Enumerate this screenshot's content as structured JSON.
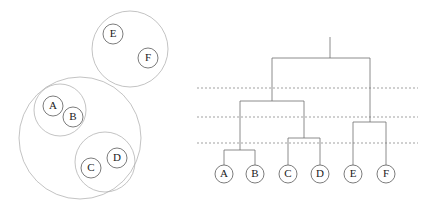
{
  "figure": {
    "width": 423,
    "height": 213,
    "background": "#ffffff",
    "stroke_light": "#a9a9a9",
    "stroke_dark": "#5a5a5a",
    "stroke_link": "#6e6e6e",
    "cut_color": "#7a7a7a"
  },
  "left_panel": {
    "title": "nested-cluster-venn",
    "items": [
      {
        "label": "A",
        "cx": 53,
        "cy": 106,
        "r": 10
      },
      {
        "label": "B",
        "cx": 73,
        "cy": 117,
        "r": 10
      },
      {
        "label": "C",
        "cx": 91,
        "cy": 168,
        "r": 10
      },
      {
        "label": "D",
        "cx": 117,
        "cy": 158,
        "r": 10
      },
      {
        "label": "E",
        "cx": 113,
        "cy": 34,
        "r": 10
      },
      {
        "label": "F",
        "cx": 148,
        "cy": 58,
        "r": 10
      }
    ],
    "groups": [
      {
        "name": "group-ab",
        "cx": 60,
        "cy": 110,
        "r": 26
      },
      {
        "name": "group-cd",
        "cx": 105,
        "cy": 162,
        "r": 30
      },
      {
        "name": "group-abcd",
        "cx": 80,
        "cy": 138,
        "r": 61
      },
      {
        "name": "group-ef",
        "cx": 130,
        "cy": 49,
        "r": 38
      }
    ]
  },
  "right_panel": {
    "title": "hierarchical-dendrogram",
    "leaves": [
      {
        "label": "A",
        "cx": 224,
        "cy": 174,
        "r": 9
      },
      {
        "label": "B",
        "cx": 255,
        "cy": 174,
        "r": 9
      },
      {
        "label": "C",
        "cx": 288,
        "cy": 174,
        "r": 9
      },
      {
        "label": "D",
        "cx": 320,
        "cy": 174,
        "r": 9
      },
      {
        "label": "E",
        "cx": 353,
        "cy": 174,
        "r": 9
      },
      {
        "label": "F",
        "cx": 386,
        "cy": 174,
        "r": 9
      }
    ],
    "links": [
      {
        "name": "merge-ab",
        "left": 224,
        "right": 255,
        "y": 150,
        "left_y": 165,
        "right_y": 165
      },
      {
        "name": "merge-cd",
        "left": 288,
        "right": 320,
        "y": 138,
        "left_y": 165,
        "right_y": 165
      },
      {
        "name": "merge-ef",
        "left": 353,
        "right": 386,
        "y": 122,
        "left_y": 165,
        "right_y": 165
      },
      {
        "name": "merge-abcd",
        "left": 240,
        "right": 304,
        "y": 101,
        "left_y": 150,
        "right_y": 138
      },
      {
        "name": "merge-root",
        "left": 272,
        "right": 370,
        "y": 58,
        "left_y": 101,
        "right_y": 122
      }
    ],
    "root_stem": {
      "x": 330,
      "y_top": 37,
      "y_bottom": 58
    },
    "cut_lines": [
      {
        "name": "cut-level-1",
        "y": 88,
        "x_start": 197,
        "x_end": 418
      },
      {
        "name": "cut-level-2",
        "y": 117,
        "x_start": 197,
        "x_end": 418
      },
      {
        "name": "cut-level-3",
        "y": 143,
        "x_start": 197,
        "x_end": 418
      }
    ]
  }
}
